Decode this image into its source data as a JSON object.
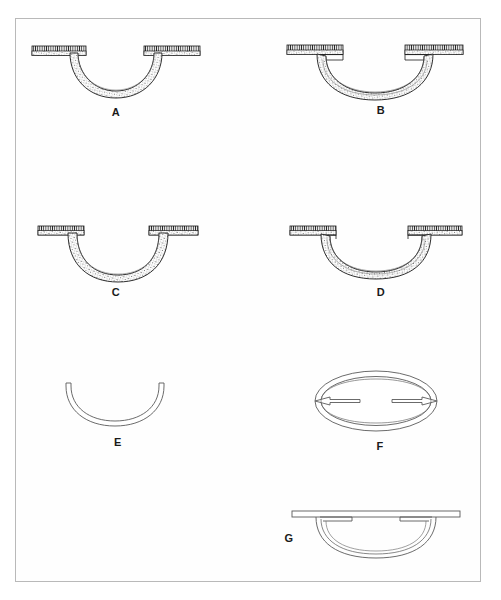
{
  "plate": {
    "title": "Ceramic vessel profile plate",
    "description": "Seven archaeological drawings of shallow bowls with horizontal flanged rims, shown in section and plan.",
    "border_color": "#b9b9b9",
    "ink_color": "#1a1a1a",
    "background_color": "#ffffff"
  },
  "figures": [
    {
      "id": "A",
      "label": "A",
      "view": "section",
      "description": "Shallow hemispherical bowl with broad horizontal flanged rim, hatched section fill",
      "label_x": 106,
      "label_y": 106,
      "fig_x": 30,
      "fig_y": 42,
      "fig_w": 170,
      "fig_h": 62,
      "rim_style": "hatched-flange",
      "has_inner_line": false
    },
    {
      "id": "B",
      "label": "B",
      "view": "section",
      "description": "Shallow bowl with flanged rim and stepped interior, double wall line showing vessel interior",
      "label_x": 371,
      "label_y": 104,
      "fig_x": 285,
      "fig_y": 42,
      "fig_w": 180,
      "fig_h": 58,
      "rim_style": "hatched-flange",
      "has_inner_line": true
    },
    {
      "id": "C",
      "label": "C",
      "view": "section",
      "description": "Deeper bowl with short flanged rim, hatched section fill",
      "label_x": 106,
      "label_y": 286,
      "fig_x": 36,
      "fig_y": 222,
      "fig_w": 160,
      "fig_h": 58,
      "rim_style": "hatched-flange",
      "has_inner_line": false
    },
    {
      "id": "D",
      "label": "D",
      "view": "section",
      "description": "Shallow bowl with flanged rim and visible interior profile line",
      "label_x": 371,
      "label_y": 286,
      "fig_x": 288,
      "fig_y": 222,
      "fig_w": 172,
      "fig_h": 58,
      "rim_style": "hatched-flange",
      "has_inner_line": true
    },
    {
      "id": "E",
      "label": "E",
      "view": "section-outline",
      "description": "Plain bowl section outline without rim, drawn as thin double arc",
      "label_x": 108,
      "label_y": 436,
      "fig_x": 62,
      "fig_y": 380,
      "fig_w": 104,
      "fig_h": 48,
      "rim_style": "outline",
      "has_inner_line": true
    },
    {
      "id": "F",
      "label": "F",
      "view": "plan",
      "description": "Plan view: oval bowl with two opposed horizontal slot handles cut into the rim",
      "label_x": 370,
      "label_y": 440,
      "fig_x": 313,
      "fig_y": 368,
      "fig_w": 122,
      "fig_h": 62,
      "rim_style": "outline",
      "has_inner_line": true
    },
    {
      "id": "G",
      "label": "G",
      "view": "elevation-outline",
      "description": "Elevation outline: bowl beneath a long straight horizontal rim bar with two small lug tabs",
      "label_x": 279,
      "label_y": 532,
      "fig_x": 290,
      "fig_y": 506,
      "fig_w": 172,
      "fig_h": 56,
      "rim_style": "outline-bar",
      "has_inner_line": true
    }
  ]
}
